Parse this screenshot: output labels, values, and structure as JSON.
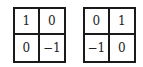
{
  "matrices": [
    {
      "name": "matrix-1",
      "cells": [
        [
          "1",
          "0"
        ],
        [
          "0",
          "−1"
        ]
      ]
    },
    {
      "name": "matrix-2",
      "cells": [
        [
          "0",
          "1"
        ],
        [
          "−1",
          "0"
        ]
      ]
    }
  ]
}
